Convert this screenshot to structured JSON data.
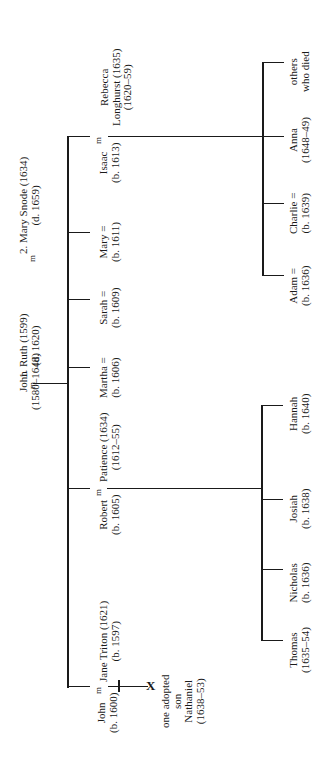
{
  "diagram": {
    "type": "family-tree",
    "orientation": "rotated-90-ccw",
    "marriage_symbol": "m",
    "root": {
      "person": {
        "name": "John",
        "dates": "(1580–1648)"
      },
      "spouse1": {
        "label": "1. Ruth (1599)",
        "dates": "(d. 1620)"
      },
      "spouse2": {
        "label": "2. Mary Snode (1634)",
        "dates": "(d. 1659)"
      }
    },
    "children": [
      {
        "name": "Isaac",
        "dates": "(b. 1613)",
        "spouse": {
          "name": "Rebecca",
          "line2": "Longhurst (1635)",
          "dates": "(1620–59)"
        }
      },
      {
        "name": "Mary =",
        "dates": "(b. 1611)"
      },
      {
        "name": "Sarah =",
        "dates": "(b. 1609)"
      },
      {
        "name": "Martha =",
        "dates": "(b. 1606)"
      },
      {
        "name": "Robert",
        "dates": "(b. 1605)",
        "spouse": {
          "name": "Patience (1634)",
          "dates": "(1612–55)"
        }
      },
      {
        "name": "John",
        "dates": "(b. 1600)",
        "spouse": {
          "name": "Jane Triton (1621)",
          "dates": "(b. 1597)"
        }
      }
    ],
    "isaac_children": [
      {
        "name": "others",
        "line2": "who died"
      },
      {
        "name": "Anna",
        "dates": "(1648–49)"
      },
      {
        "name": "Charlie =",
        "dates": "(b. 1639)"
      },
      {
        "name": "Adam =",
        "dates": "(b. 1636)"
      }
    ],
    "robert_children": [
      {
        "name": "Hannah",
        "dates": "(b. 1640)"
      },
      {
        "name": "Josiah",
        "dates": "(b. 1638)"
      },
      {
        "name": "Nicholas",
        "dates": "(b. 1636)"
      },
      {
        "name": "Thomas",
        "dates": "(1635–54)"
      }
    ],
    "john_child": {
      "l1": "one adopted",
      "l2": "son",
      "l3": "Nathaniel",
      "l4": "(1638–53)",
      "marker": "X"
    }
  }
}
